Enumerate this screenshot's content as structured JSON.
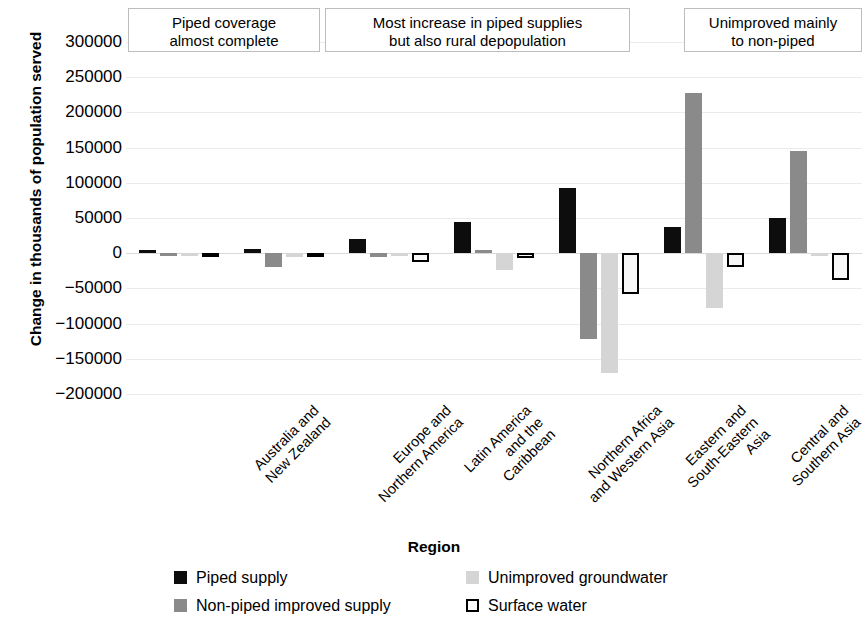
{
  "chart_data": {
    "type": "bar",
    "title": "",
    "xlabel": "Region",
    "ylabel": "Change in thousands of population served",
    "ylim": [
      -200000,
      300000
    ],
    "ytick_labels": [
      "300000",
      "250000",
      "200000",
      "150000",
      "100000",
      "50000",
      "0",
      "−50000",
      "−100000",
      "−150000",
      "−200000"
    ],
    "ytick_values": [
      300000,
      250000,
      200000,
      150000,
      100000,
      50000,
      0,
      -50000,
      -100000,
      -150000,
      -200000
    ],
    "grid": true,
    "legend_position": "bottom",
    "categories": [
      "Australia and\nNew Zealand",
      "Europe and\nNorthern America",
      "Latin America\nand the\nCaribbean",
      "Northern Africa\nand Western Asia",
      "Eastern and\nSouth-Eastern\nAsia",
      "Central and\nSouthern Asia",
      "Sub-Saharan\nAfrica"
    ],
    "series": [
      {
        "name": "Piped supply",
        "color": "#0d0d0d",
        "values": [
          2000,
          6000,
          20000,
          45000,
          92000,
          37000,
          50000
        ]
      },
      {
        "name": "Non-piped improved supply",
        "color": "#8a8a8a",
        "values": [
          -1000,
          -20000,
          -6000,
          5000,
          -122000,
          227000,
          145000
        ]
      },
      {
        "name": "Unimproved groundwater",
        "color": "#d5d5d5",
        "values": [
          -1000,
          -5000,
          -3000,
          -24000,
          -170000,
          -78000,
          -2000
        ]
      },
      {
        "name": "Surface water",
        "color": "#ffffff",
        "values": [
          -1000,
          -6000,
          -12000,
          -7000,
          -58000,
          -20000,
          -38000
        ]
      }
    ],
    "annotations": [
      {
        "text": "Piped coverage\nalmost complete"
      },
      {
        "text": "Most increase in piped supplies\nbut also rural depopulation"
      },
      {
        "text": "Unimproved mainly\nto non-piped"
      }
    ]
  }
}
